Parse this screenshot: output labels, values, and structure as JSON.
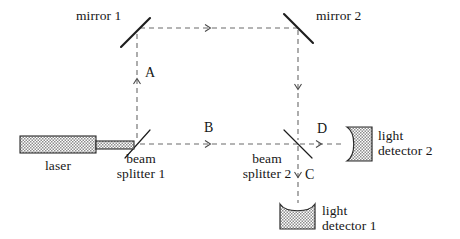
{
  "figure": {
    "background": "#ffffff",
    "ink": "#161616",
    "beam_color": "#6a6a6a",
    "hatch_color": "#8a8a8a"
  },
  "components": {
    "mirror1": {
      "label": "mirror 1"
    },
    "mirror2": {
      "label": "mirror 2"
    },
    "beam_splitter1": {
      "label_line1": "beam",
      "label_line2": "splitter 1"
    },
    "beam_splitter2": {
      "label_line1": "beam",
      "label_line2": "splitter 2"
    },
    "laser": {
      "label": "laser"
    },
    "detector1": {
      "label_line1": "light",
      "label_line2": "detector 1"
    },
    "detector2": {
      "label_line1": "light",
      "label_line2": "detector 2"
    }
  },
  "beam_labels": {
    "a": "A",
    "b": "B",
    "c": "C",
    "d": "D"
  }
}
